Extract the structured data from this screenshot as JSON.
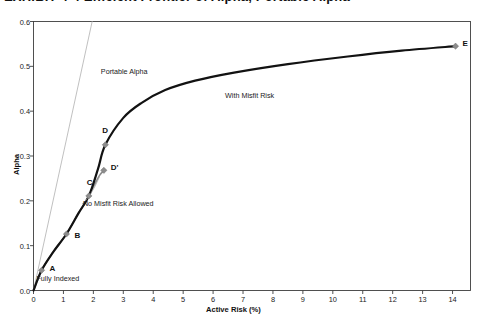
{
  "figure": {
    "title_clipped": "EXHIBIT 4-4  Efficient Frontier of Alpha, Portable Alpha",
    "title_visible": "partially cut off at top edge"
  },
  "chart_data": {
    "type": "line",
    "title": "EXHIBIT 4-4  Efficient Frontier of Alpha, Portable Alpha",
    "xlabel": "Active Risk (%)",
    "ylabel": "Alpha",
    "xlim": [
      0,
      14.6
    ],
    "ylim": [
      0.0,
      0.6
    ],
    "xticks": [
      0,
      1,
      2,
      3,
      4,
      5,
      6,
      7,
      8,
      9,
      10,
      11,
      12,
      13,
      14
    ],
    "yticks": [
      "0.0",
      "0.1",
      "0.2",
      "0.3",
      "0.4",
      "0.5",
      "0.6"
    ],
    "grid": false,
    "legend": "none",
    "series": [
      {
        "name": "With Misfit Risk",
        "color": "#121212",
        "width": 2.2,
        "points": [
          {
            "x": 0.0,
            "y": 0.0
          },
          {
            "x": 0.27,
            "y": 0.045
          },
          {
            "x": 0.65,
            "y": 0.085
          },
          {
            "x": 1.1,
            "y": 0.126
          },
          {
            "x": 1.5,
            "y": 0.172
          },
          {
            "x": 1.85,
            "y": 0.211
          },
          {
            "x": 2.15,
            "y": 0.27
          },
          {
            "x": 2.4,
            "y": 0.325
          },
          {
            "x": 3.0,
            "y": 0.385
          },
          {
            "x": 3.6,
            "y": 0.418
          },
          {
            "x": 4.4,
            "y": 0.447
          },
          {
            "x": 5.4,
            "y": 0.468
          },
          {
            "x": 6.7,
            "y": 0.486
          },
          {
            "x": 8.5,
            "y": 0.505
          },
          {
            "x": 10.5,
            "y": 0.522
          },
          {
            "x": 12.3,
            "y": 0.535
          },
          {
            "x": 14.1,
            "y": 0.545
          }
        ]
      },
      {
        "name": "No Misfit Risk Allowed",
        "color": "#8c8c8c",
        "width": 1.6,
        "points": [
          {
            "x": 0.0,
            "y": 0.0
          },
          {
            "x": 0.27,
            "y": 0.045
          },
          {
            "x": 0.65,
            "y": 0.085
          },
          {
            "x": 1.1,
            "y": 0.126
          },
          {
            "x": 1.5,
            "y": 0.172
          },
          {
            "x": 1.85,
            "y": 0.211
          },
          {
            "x": 2.05,
            "y": 0.238
          },
          {
            "x": 2.22,
            "y": 0.258
          },
          {
            "x": 2.35,
            "y": 0.268
          }
        ]
      },
      {
        "name": "Portable Alpha",
        "color": "#b0b0b0",
        "width": 0.8,
        "points": [
          {
            "x": 0.0,
            "y": 0.0
          },
          {
            "x": 1.96,
            "y": 0.6
          }
        ]
      }
    ],
    "markers": [
      {
        "label": "A",
        "x": 0.27,
        "y": 0.045,
        "color": "#8c8c8c",
        "label_dx": 8,
        "label_dy": -2
      },
      {
        "label": "B",
        "x": 1.1,
        "y": 0.126,
        "color": "#8c8c8c",
        "label_dx": 8,
        "label_dy": 1
      },
      {
        "label": "C",
        "x": 1.85,
        "y": 0.211,
        "color": "#8c8c8c",
        "label_dx": -2,
        "label_dy": -14
      },
      {
        "label": "D",
        "x": 2.4,
        "y": 0.325,
        "color": "#8c8c8c",
        "label_dx": -3,
        "label_dy": -15
      },
      {
        "label": "D'",
        "x": 2.35,
        "y": 0.268,
        "color": "#8c8c8c",
        "label_dx": 7,
        "label_dy": -3
      },
      {
        "label": "E",
        "x": 14.1,
        "y": 0.545,
        "color": "#8c8c8c",
        "label_dx": 7,
        "label_dy": -3
      }
    ],
    "annotations": [
      {
        "text": "Portable Alpha",
        "x": 2.25,
        "y": 0.49
      },
      {
        "text": "With Misfit Risk",
        "x": 6.4,
        "y": 0.437
      },
      {
        "text": "No Misfit Risk Allowed",
        "x": 1.65,
        "y": 0.195
      },
      {
        "text": "Fully Indexed",
        "x": 0.1,
        "y": 0.027
      }
    ]
  }
}
